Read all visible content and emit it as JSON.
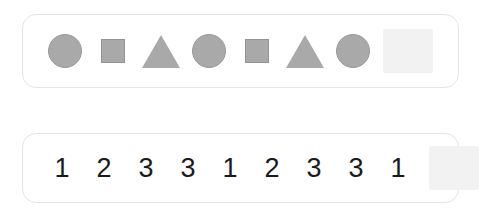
{
  "page": {
    "background_color": "#ffffff"
  },
  "colors": {
    "shape_fill": "#a9a9a9",
    "shape_stroke": "#9b9b9b",
    "panel_border": "#e3e5e6",
    "blank_slot_fill": "#f2f2f2",
    "digit_color": "#1a1a1a"
  },
  "shape_row": {
    "name": "shape-sequence-row",
    "items": [
      {
        "kind": "shape",
        "icon": "circle-icon",
        "label": "circle"
      },
      {
        "kind": "shape",
        "icon": "square-icon",
        "label": "square"
      },
      {
        "kind": "shape",
        "icon": "triangle-icon",
        "label": "triangle"
      },
      {
        "kind": "shape",
        "icon": "circle-icon",
        "label": "circle"
      },
      {
        "kind": "shape",
        "icon": "square-icon",
        "label": "square"
      },
      {
        "kind": "shape",
        "icon": "triangle-icon",
        "label": "triangle"
      },
      {
        "kind": "shape",
        "icon": "circle-icon",
        "label": "circle"
      },
      {
        "kind": "blank",
        "icon": "blank-slot-icon",
        "label": ""
      }
    ]
  },
  "number_row": {
    "name": "number-sequence-row",
    "items": [
      {
        "kind": "digit",
        "value": "1"
      },
      {
        "kind": "digit",
        "value": "2"
      },
      {
        "kind": "digit",
        "value": "3"
      },
      {
        "kind": "digit",
        "value": "3"
      },
      {
        "kind": "digit",
        "value": "1"
      },
      {
        "kind": "digit",
        "value": "2"
      },
      {
        "kind": "digit",
        "value": "3"
      },
      {
        "kind": "digit",
        "value": "3"
      },
      {
        "kind": "digit",
        "value": "1"
      },
      {
        "kind": "blank",
        "value": ""
      }
    ]
  }
}
